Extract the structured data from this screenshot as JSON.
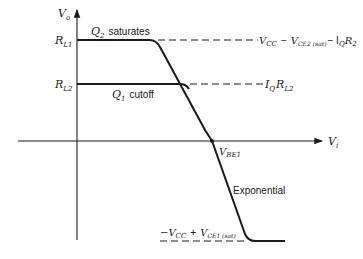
{
  "diagram": {
    "axes": {
      "y_label": "V",
      "y_label_sub": "o",
      "x_label": "V",
      "x_label_sub": "i"
    },
    "levels": {
      "rl1_label": "R",
      "rl1_sub": "L1",
      "rl2_label": "R",
      "rl2_sub": "L2"
    },
    "annotations": {
      "q2_label": "Q",
      "q2_sub": "2",
      "q2_text": "saturates",
      "q1_label": "Q",
      "q1_sub": "1",
      "q1_text": "cutoff",
      "vbe_label": "V",
      "vbe_sub": "BE1",
      "exponential": "Exponential"
    },
    "right_labels": {
      "top_vcc": "V",
      "top_vcc_sub": "CC",
      "top_minus1": "−",
      "top_vce": "V",
      "top_vce_sub": "CE2 (sat)",
      "top_minus2": "− I",
      "top_iq_sub": "Q",
      "top_r": "R",
      "top_r_sub": "2",
      "mid_i": "I",
      "mid_i_sub": "Q",
      "mid_r": "R",
      "mid_r_sub": "L2"
    },
    "bottom_label": {
      "minus_vcc": "−V",
      "vcc_sub": "CC",
      "plus": "+",
      "vce": "V",
      "vce_sub": "CE1 (sat)"
    },
    "colors": {
      "ink": "#1a1a1a",
      "background": "#ffffff"
    }
  }
}
